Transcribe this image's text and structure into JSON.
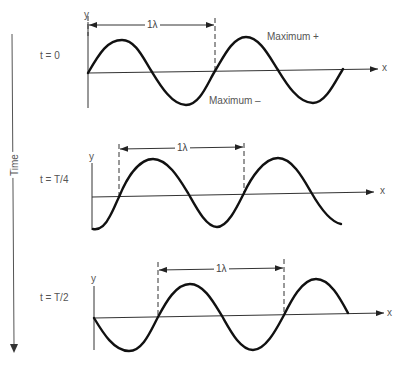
{
  "time_axis": {
    "label": "Time",
    "direction": "down"
  },
  "panels": [
    {
      "time_label": "t = 0",
      "y_axis_label": "y",
      "x_axis_label": "x",
      "wavelength_label": "1λ",
      "annotations": {
        "max_plus": "Maximum +",
        "max_minus": "Maximum –"
      }
    },
    {
      "time_label": "t = T/4",
      "y_axis_label": "y",
      "x_axis_label": "x",
      "wavelength_label": "1λ"
    },
    {
      "time_label": "t = T/2",
      "y_axis_label": "y",
      "x_axis_label": "x",
      "wavelength_label": "1λ"
    }
  ],
  "colors": {
    "wave": "#111111",
    "axis": "#333333",
    "text": "#555555"
  }
}
